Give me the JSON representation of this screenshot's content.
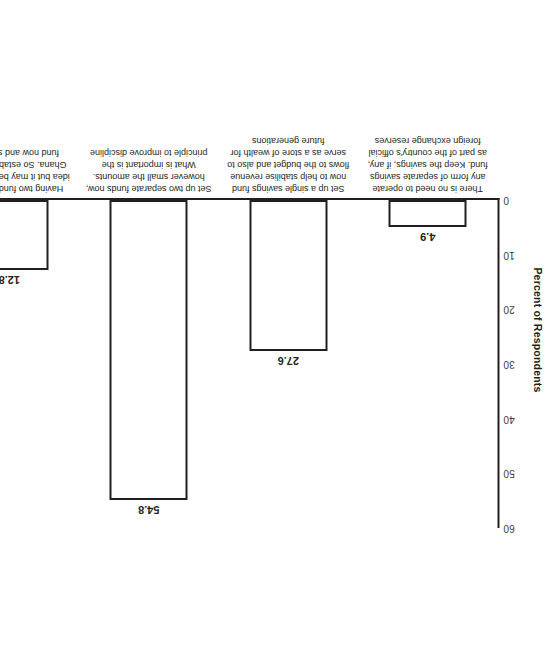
{
  "chart_data": {
    "type": "bar",
    "title": "",
    "subtitle": "",
    "xlabel": "",
    "ylabel": "Percent of Respondents",
    "ylim": [
      0,
      60
    ],
    "yticks": [
      0,
      10,
      20,
      30,
      40,
      50,
      60
    ],
    "grid": false,
    "legend": "none",
    "orientation": "vertical",
    "rotated_180": true,
    "categories": [
      "There is no need to operate any form of separate savings fund. Keep the savings, if any, as part of the country's official foreign exchange reserves",
      "Set up a single savings fund now to help stabilise revenue flows to the budget and also to serve as a store of wealth for future generations",
      "Set up two separate funds now, however small the amounts. What is important is the principle to improve discipline",
      "Having two funds is a good idea but it may be too early for Ghana. So establish a single fund now and split it later"
    ],
    "values": [
      4.9,
      27.6,
      54.8,
      12.8
    ],
    "value_labels": [
      "4.9",
      "27.6",
      "54.8",
      "12.8"
    ],
    "ytick_labels": [
      "0",
      "10",
      "20",
      "30",
      "40",
      "50",
      "60"
    ],
    "bar_fill": "#ffffff",
    "bar_stroke": "#231f20",
    "axis_color": "#231f20",
    "text_color": "#231f20",
    "background": "#ffffff"
  }
}
